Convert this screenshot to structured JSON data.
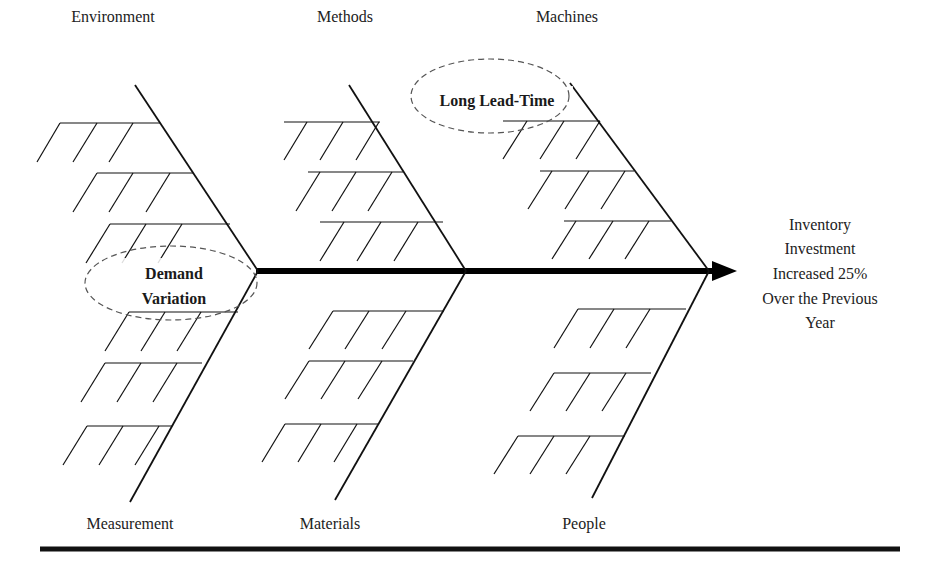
{
  "diagram": {
    "type": "fishbone",
    "effect": {
      "lines": [
        "Inventory",
        "Investment",
        "Increased 25%",
        "Over the Previous",
        "Year"
      ]
    },
    "categories": {
      "top": [
        "Environment",
        "Methods",
        "Machines"
      ],
      "bottom": [
        "Measurement",
        "Materials",
        "People"
      ]
    },
    "highlighted_causes": [
      {
        "category": "Environment",
        "lines": [
          "Demand",
          "Variation"
        ]
      },
      {
        "category": "Machines",
        "lines": [
          "Long Lead-Time"
        ]
      }
    ],
    "colors": {
      "line": "#111111",
      "text": "#222222",
      "background": "#ffffff",
      "dashed_ellipse": "#555555"
    }
  }
}
